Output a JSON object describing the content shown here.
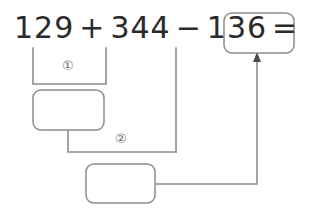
{
  "diagram": {
    "stroke_color": "#8c8c8c",
    "text_color": "#2b2b2b",
    "marker_color": "#6a6a6a",
    "equation": {
      "term1": "129",
      "op1": "+",
      "term2": "344",
      "op2": "−",
      "term3": "136",
      "equals": "="
    },
    "markers": [
      {
        "id": "step-1",
        "label": "①"
      },
      {
        "id": "step-2",
        "label": "②"
      }
    ],
    "boxes": [
      {
        "id": "sum1",
        "value": ""
      },
      {
        "id": "sum2",
        "value": ""
      },
      {
        "id": "answer",
        "value": ""
      }
    ]
  }
}
